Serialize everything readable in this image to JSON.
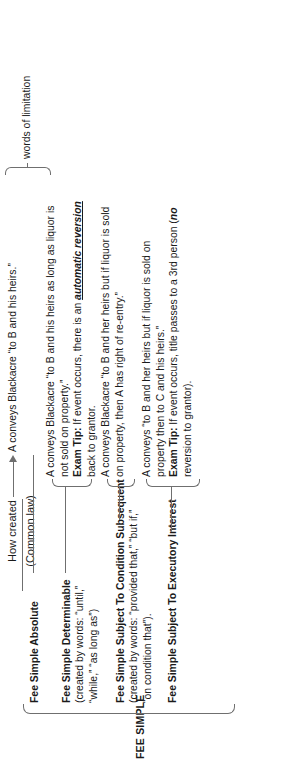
{
  "diagram": {
    "type": "tree",
    "orientation": "rotated-90-ccw",
    "root": {
      "label": "FEE SIMPLE"
    },
    "header": {
      "title": "How created",
      "subtitle": "(Common law)",
      "arrow": "arrow-right-icon"
    },
    "annotation": {
      "words_of_limitation": "words of limitation"
    },
    "branches": [
      {
        "name": "Fee Simple Absolute",
        "subtitle": "",
        "description_lines": [
          "A conveys Blackacre “to B and his heirs.”"
        ],
        "exam_tip_label": "",
        "exam_tip_lines": []
      },
      {
        "name": "Fee Simple Determinable",
        "subtitle_lines": [
          "(created by words: “until,”",
          "“while,” “as long as”)"
        ],
        "description_lines": [
          "A conveys Blackacre “to B and his heirs as long as liquor is",
          "not sold on property.”"
        ],
        "exam_tip_label": "Exam Tip:",
        "exam_tip_lines": [
          " If event occurs, there is an ",
          "back to grantor."
        ],
        "exam_tip_emphasis": "automatic reversion"
      },
      {
        "name": "Fee Simple Subject To Condition Subsequent",
        "subtitle_lines": [
          "(created by words: “provided that,” “but if,”",
          "“on condition that”)."
        ],
        "description_lines": [
          "A conveys Blackacre “to B and her heirs but if liquor is sold",
          "on property, then A has right of re-entry.”"
        ],
        "exam_tip_label": "",
        "exam_tip_lines": []
      },
      {
        "name": "Fee Simple Subject To Executory Interest",
        "subtitle_lines": [],
        "description_lines": [
          "A conveys “to B and her heirs but if liquor is sold on",
          "property then to C and his heirs.”"
        ],
        "exam_tip_label": "Exam Tip:",
        "exam_tip_lines": [
          " If event occurs, title passes to a 3rd person (",
          "reversion to grantor)."
        ],
        "exam_tip_emphasis": "no"
      }
    ]
  },
  "style": {
    "line_color": "#6f6f6f",
    "text_color": "#1a1a1a",
    "background": "#ffffff"
  }
}
